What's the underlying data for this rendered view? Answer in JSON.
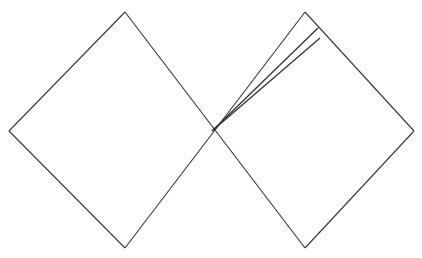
{
  "figure": {
    "kind": "penrose-conformal-diagram",
    "background_color": "#ffffff",
    "line_color": "#3a3a3a",
    "label_color": "#4a4a4a",
    "canvas": {
      "width": 422,
      "height": 258
    }
  },
  "geometry": {
    "center": {
      "x": 212,
      "y": 131
    },
    "left_vertex": {
      "x": 9,
      "y": 131
    },
    "right_vertex": {
      "x": 414,
      "y": 131
    },
    "top_left_corner": {
      "x": 125,
      "y": 12
    },
    "top_right_corner": {
      "x": 305,
      "y": 12
    },
    "bottom_left_corner": {
      "x": 125,
      "y": 248
    },
    "bottom_right_corner": {
      "x": 305,
      "y": 248
    },
    "zigzag_teeth": 9,
    "zigzag_amplitude": 9
  },
  "edges": [
    {
      "name": "upper-left-null-boundary",
      "from": "left_vertex",
      "to": "top_left_corner"
    },
    {
      "name": "upper-right-null-boundary",
      "from": "top_right_corner",
      "to": "right_vertex"
    },
    {
      "name": "lower-left-null-boundary",
      "from": "left_vertex",
      "to": "bottom_left_corner"
    },
    {
      "name": "lower-right-null-boundary",
      "from": "bottom_right_corner",
      "to": "right_vertex"
    }
  ],
  "horizons": [
    {
      "name": "future-horizon",
      "from": {
        "x": 125,
        "y": 12
      },
      "to": {
        "x": 305,
        "y": 248
      }
    },
    {
      "name": "past-horizon",
      "from": {
        "x": 125,
        "y": 248
      },
      "to": {
        "x": 305,
        "y": 12
      }
    }
  ],
  "singularities": [
    {
      "name": "future-singularity",
      "position": "top",
      "teeth": 9,
      "x_start": 125,
      "x_end": 305,
      "y_base": 12
    },
    {
      "name": "past-singularity",
      "position": "bottom",
      "teeth": 9,
      "x_start": 125,
      "x_end": 305,
      "y_base": 248
    }
  ],
  "wedge": {
    "name": "delta-wedge",
    "apex": {
      "x": 212,
      "y": 131
    },
    "upper_end": {
      "x": 318,
      "y": 28
    },
    "lower_end": {
      "x": 320,
      "y": 38
    },
    "label": "Δ",
    "label_position": {
      "x": 273,
      "y": 98
    }
  },
  "labels": [
    {
      "name": "delta-label",
      "text": "Δ"
    }
  ]
}
